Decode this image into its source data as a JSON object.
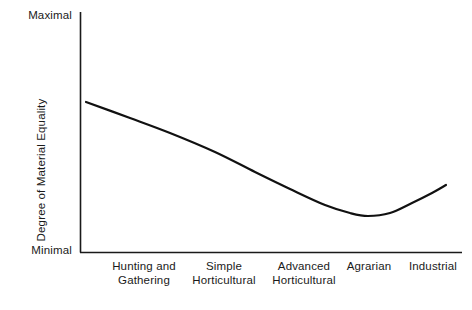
{
  "chart_data": {
    "type": "line",
    "title": "",
    "subtitle": "",
    "xlabel": "",
    "ylabel": "Degree of Material Equality",
    "categories": [
      "Hunting and Gathering",
      "Simple Horticultural",
      "Advanced Horticultural",
      "Agrarian",
      "Industrial"
    ],
    "category_lines": [
      [
        "Hunting and",
        "Gathering"
      ],
      [
        "Simple",
        "Horticultural"
      ],
      [
        "Advanced",
        "Horticultural"
      ],
      [
        "Agrarian"
      ],
      [
        "Industrial"
      ]
    ],
    "y_axis_ticks": [
      "Maximal",
      "Minimal"
    ],
    "y_tick_top": "Maximal",
    "y_tick_bottom": "Minimal",
    "ylim": [
      "Minimal",
      "Maximal"
    ],
    "grid": false,
    "legend": false,
    "legend_position": "none",
    "series": [
      {
        "name": "Degree of Material Equality",
        "values": [
          0.62,
          0.49,
          0.33,
          0.15,
          0.27
        ],
        "note": "Qualitative ordinal scale: 0 = Minimal, 1 = Maximal"
      }
    ],
    "curve_points": [
      {
        "x": 86,
        "y": 102
      },
      {
        "x": 130,
        "y": 118
      },
      {
        "x": 170,
        "y": 133
      },
      {
        "x": 215,
        "y": 152
      },
      {
        "x": 255,
        "y": 172
      },
      {
        "x": 290,
        "y": 189
      },
      {
        "x": 325,
        "y": 205
      },
      {
        "x": 350,
        "y": 213
      },
      {
        "x": 368,
        "y": 216
      },
      {
        "x": 390,
        "y": 213
      },
      {
        "x": 412,
        "y": 203
      },
      {
        "x": 432,
        "y": 193
      },
      {
        "x": 446,
        "y": 185
      }
    ],
    "annotations": []
  },
  "style": {
    "background_color": "#ffffff",
    "axis_color": "#1a1a1a",
    "curve_color": "#111111",
    "text_color": "#1a1a1a"
  },
  "geometry": {
    "axis_x": 80,
    "axis_y_top": 12,
    "axis_y_bottom": 252,
    "axis_x_right": 462,
    "x_tick_centers": [
      144,
      224,
      304,
      369,
      433
    ]
  }
}
